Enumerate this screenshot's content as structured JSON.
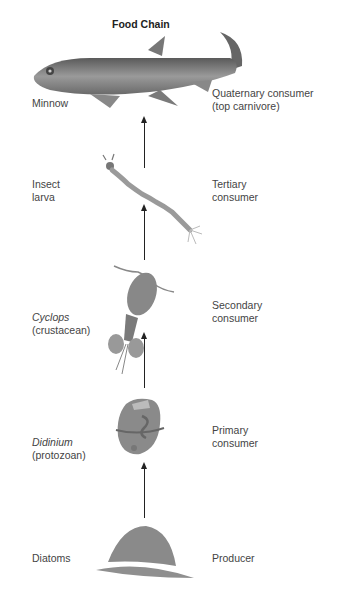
{
  "title": "Food Chain",
  "chain": [
    {
      "organism": "Minnow",
      "organism_sub": "",
      "role": "Quaternary consumer",
      "role_sub": "(top carnivore)"
    },
    {
      "organism": "Insect",
      "organism_sub": "larva",
      "role": "Tertiary",
      "role_sub": "consumer"
    },
    {
      "organism": "Cyclops",
      "organism_sub": "(crustacean)",
      "role": "Secondary",
      "role_sub": "consumer"
    },
    {
      "organism": "Didinium",
      "organism_sub": "(protozoan)",
      "role": "Primary",
      "role_sub": "consumer"
    },
    {
      "organism": "Diatoms",
      "organism_sub": "",
      "role": "Producer",
      "role_sub": ""
    }
  ],
  "colors": {
    "arrow": "#222222",
    "text": "#444444",
    "organism_fill": "#8a8a8a"
  }
}
